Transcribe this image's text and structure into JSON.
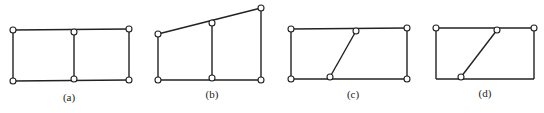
{
  "figures": [
    {
      "id": "a",
      "label": "(a)",
      "members": [
        [
          13,
          30,
          129,
          29
        ],
        [
          13,
          81,
          129,
          80
        ],
        [
          13,
          30,
          13,
          81
        ],
        [
          129,
          29,
          129,
          80
        ],
        [
          74,
          32,
          74,
          79
        ]
      ],
      "hinges": [
        [
          13,
          30
        ],
        [
          74,
          32
        ],
        [
          129,
          29
        ],
        [
          13,
          81
        ],
        [
          74,
          79
        ],
        [
          129,
          80
        ]
      ],
      "label_pos": [
        69,
        101
      ]
    },
    {
      "id": "b",
      "label": "(b)",
      "members": [
        [
          158,
          34,
          261,
          8
        ],
        [
          158,
          80,
          261,
          80
        ],
        [
          158,
          34,
          158,
          80
        ],
        [
          261,
          8,
          261,
          80
        ],
        [
          212,
          23,
          212,
          78
        ]
      ],
      "hinges": [
        [
          158,
          34
        ],
        [
          212,
          23
        ],
        [
          261,
          8
        ],
        [
          158,
          80
        ],
        [
          212,
          78
        ],
        [
          261,
          80
        ]
      ],
      "label_pos": [
        212,
        98
      ]
    },
    {
      "id": "c",
      "label": "(c)",
      "members": [
        [
          291,
          29,
          407,
          28
        ],
        [
          291,
          79,
          407,
          79
        ],
        [
          291,
          29,
          291,
          79
        ],
        [
          407,
          28,
          407,
          79
        ],
        [
          356,
          31,
          330,
          77
        ]
      ],
      "hinges": [
        [
          291,
          29
        ],
        [
          356,
          31
        ],
        [
          407,
          28
        ],
        [
          291,
          79
        ],
        [
          330,
          77
        ],
        [
          407,
          79
        ]
      ],
      "label_pos": [
        353,
        98
      ]
    },
    {
      "id": "d",
      "label": "(d)",
      "members": [
        [
          436,
          28,
          534,
          28
        ],
        [
          436,
          79,
          534,
          79
        ],
        [
          436,
          28,
          436,
          79
        ],
        [
          534,
          28,
          534,
          79
        ],
        [
          497,
          30,
          461,
          77
        ]
      ],
      "hinges": [
        [
          436,
          28
        ],
        [
          497,
          30
        ],
        [
          534,
          28
        ],
        [
          461,
          77
        ]
      ],
      "label_pos": [
        485,
        97
      ]
    }
  ],
  "style": {
    "line_color": "#222222",
    "background": "#ffffff"
  }
}
